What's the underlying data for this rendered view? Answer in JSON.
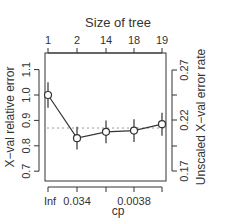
{
  "chart_data": {
    "type": "line",
    "title": "Size of tree",
    "xlabel": "cp",
    "ylabel": "X−val relative error",
    "ylabel_right": "Unscaled X−val error rate",
    "top_axis": {
      "label": "Size of tree",
      "ticks": [
        "1",
        "2",
        "14",
        "18",
        "19"
      ]
    },
    "bottom_axis": {
      "ticks": [
        "Inf",
        "0.034",
        "",
        "0.0038",
        ""
      ]
    },
    "left_axis": {
      "ticks": [
        "0.7",
        "0.8",
        "0.9",
        "1.0",
        "1.1"
      ],
      "ylim": [
        0.67,
        1.17
      ]
    },
    "right_axis": {
      "ticks": [
        "0.17",
        "0.22",
        "0.27"
      ]
    },
    "series": [
      {
        "name": "X-val relative error",
        "x": [
          "Inf",
          "0.034",
          "",
          "0.0038",
          ""
        ],
        "tree_size": [
          1,
          2,
          14,
          18,
          19
        ],
        "values": [
          1.0,
          0.83,
          0.855,
          0.86,
          0.885
        ],
        "error": [
          0.05,
          0.045,
          0.045,
          0.045,
          0.045
        ]
      }
    ],
    "reference_line": {
      "value": 0.87,
      "style": "dotted"
    },
    "grid": false
  }
}
